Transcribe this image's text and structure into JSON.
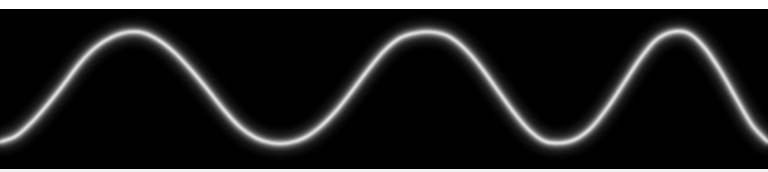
{
  "figure": {
    "title": "",
    "background_color": "#000000",
    "frame_color": "#ffffff",
    "wave_color": "#ffffff",
    "glow_color": "#b4b4b4",
    "width_px": 768,
    "height_px": 172
  },
  "bands": {
    "top_label": "",
    "bottom_label": ""
  },
  "chart_data": {
    "type": "line",
    "title": "",
    "subtitle": "",
    "xlabel": "",
    "ylabel": "",
    "xlim": [
      0,
      768
    ],
    "ylim": [
      172,
      0
    ],
    "grid": false,
    "legend": null,
    "annotations": [],
    "series": [
      {
        "name": "glowing-sine-chirp",
        "color": "#ffffff",
        "line_width_px": 3,
        "glow_width_px": 13,
        "description": "Bright white sinusoid with soft gaussian glow on black background; frequency increases slightly from left to right (chirp).",
        "baseline_y": 88,
        "amplitude_y": 56,
        "peaks_x": [
          125,
          437,
          665
        ],
        "peaks_y": [
          32,
          32,
          32
        ],
        "troughs_x": [
          0,
          290,
          553,
          762
        ],
        "troughs_y": [
          143,
          143,
          143,
          143
        ],
        "zero_crossings_x": [
          48,
          205,
          365,
          495,
          610,
          718
        ],
        "wavelengths_px": [
          312,
          228
        ],
        "x": [
          0,
          16,
          32,
          48,
          64,
          80,
          96,
          112,
          128,
          144,
          160,
          176,
          192,
          208,
          224,
          240,
          256,
          272,
          288,
          304,
          320,
          336,
          352,
          368,
          384,
          400,
          416,
          432,
          448,
          464,
          480,
          496,
          512,
          528,
          544,
          560,
          576,
          592,
          608,
          624,
          640,
          656,
          672,
          688,
          704,
          720,
          736,
          752,
          768
        ],
        "y": [
          142,
          136,
          122,
          104,
          84,
          63,
          47,
          37,
          32,
          33,
          41,
          54,
          71,
          90,
          110,
          127,
          138,
          143,
          143,
          138,
          127,
          111,
          91,
          70,
          51,
          38,
          33,
          32,
          36,
          48,
          66,
          88,
          110,
          129,
          141,
          143,
          139,
          127,
          107,
          83,
          59,
          40,
          32,
          33,
          47,
          70,
          98,
          125,
          142
        ]
      }
    ]
  }
}
